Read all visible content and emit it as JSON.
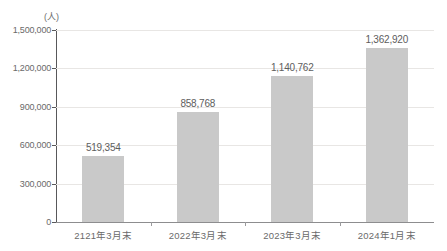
{
  "chart_data": {
    "type": "bar",
    "title": "",
    "subtitle": "",
    "xlabel": "",
    "ylabel": "(人)",
    "unit_label": "(人)",
    "categories": [
      "2121年3月末",
      "2022年3月末",
      "2023年3月末",
      "2024年1月末"
    ],
    "values": [
      519354,
      858768,
      1140762,
      1362920
    ],
    "value_labels": [
      "519,354",
      "858,768",
      "1,140,762",
      "1,362,920"
    ],
    "ylim": [
      0,
      1500000
    ],
    "ytick_values": [
      0,
      300000,
      600000,
      900000,
      1200000,
      1500000
    ],
    "ytick_labels": [
      "0",
      "300,000",
      "600,000",
      "900,000",
      "1,200,000",
      "1,500,000"
    ],
    "grid": true,
    "grid_axis": "y",
    "legend": false,
    "legend_position": "none",
    "bar_color": "#c9c9c9",
    "axis_color": "#58585a",
    "grid_color": "#e8e6e4",
    "text_color": "#6a6a6a",
    "background": "#ffffff"
  }
}
